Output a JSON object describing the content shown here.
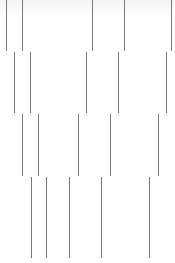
{
  "canvas": {
    "width": 175,
    "height": 263,
    "background": "#ffffff",
    "line_color": "#7a7a7a"
  },
  "rows": [
    {
      "top": 0,
      "height": 51,
      "lines": [
        6,
        22,
        92,
        124,
        171
      ]
    },
    {
      "top": 52,
      "height": 61,
      "lines": [
        14,
        30,
        86,
        118,
        166
      ]
    },
    {
      "top": 114,
      "height": 62,
      "lines": [
        22,
        38,
        78,
        110,
        158
      ]
    },
    {
      "top": 177,
      "height": 81,
      "lines": [
        31,
        46,
        69,
        101,
        149
      ]
    }
  ]
}
